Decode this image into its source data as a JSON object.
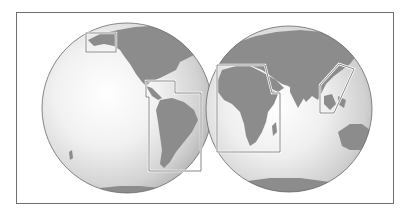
{
  "map": {
    "type": "world-hemispheres",
    "colors": {
      "background": "#ffffff",
      "frame": "#6e6e6e",
      "ocean_highlight": "#ffffff",
      "ocean_edge": "#b4b4b4",
      "land": "#8c8c8c",
      "region_outline": "#ffffff"
    },
    "hemispheres": [
      {
        "name": "western-hemisphere",
        "center": [
          127,
          108
        ],
        "radius": 85
      },
      {
        "name": "eastern-hemisphere",
        "center": [
          289,
          109
        ],
        "radius": 83
      }
    ],
    "highlighted_regions": [
      {
        "name": "alaska",
        "hemisphere": "western"
      },
      {
        "name": "central-and-south-america",
        "hemisphere": "western"
      },
      {
        "name": "africa",
        "hemisphere": "eastern"
      },
      {
        "name": "southeast-asia",
        "hemisphere": "eastern"
      }
    ]
  }
}
